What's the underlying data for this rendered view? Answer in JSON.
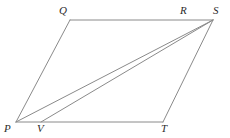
{
  "figure": {
    "type": "geometry-diagram",
    "shape": "parallelogram-with-diagonals",
    "background_color": "#ffffff",
    "stroke_color": "#8a8a8a",
    "label_color": "#2b2b2b",
    "stroke_width": 1,
    "canvas": {
      "width": 230,
      "height": 138
    }
  },
  "points": {
    "P": {
      "label": "P",
      "x": 16,
      "y": 122,
      "label_x": 4,
      "label_y": 123
    },
    "Q": {
      "label": "Q",
      "x": 70,
      "y": 20,
      "label_x": 59,
      "label_y": 5
    },
    "R": {
      "label": "R",
      "x": 186,
      "y": 20,
      "label_x": 180,
      "label_y": 5
    },
    "S": {
      "label": "S",
      "x": 213,
      "y": 20,
      "label_x": 213,
      "label_y": 5
    },
    "T": {
      "label": "T",
      "x": 163,
      "y": 122,
      "label_x": 161,
      "label_y": 123
    },
    "V": {
      "label": "V",
      "x": 41,
      "y": 122,
      "label_x": 37,
      "label_y": 123
    }
  },
  "segments": [
    {
      "name": "edge-PQ",
      "from": "P",
      "to": "Q"
    },
    {
      "name": "edge-QS",
      "from": "Q",
      "to": "S"
    },
    {
      "name": "edge-ST",
      "from": "S",
      "to": "T"
    },
    {
      "name": "edge-TP",
      "from": "T",
      "to": "P"
    },
    {
      "name": "diagonal-PS",
      "from": "P",
      "to": "S"
    },
    {
      "name": "diagonal-VS",
      "from": "V",
      "to": "S"
    }
  ]
}
